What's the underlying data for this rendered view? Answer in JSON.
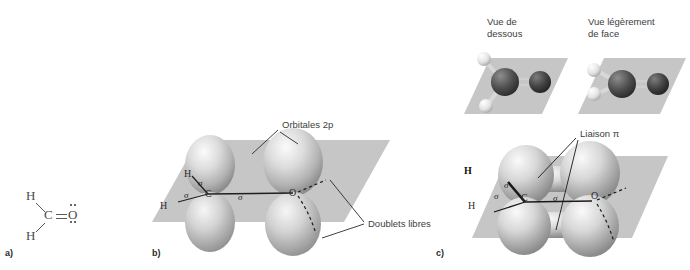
{
  "figure": {
    "panels": [
      {
        "id": "a",
        "letter": "a)",
        "caption": "Structure de Lewis"
      },
      {
        "id": "b",
        "letter": "b)",
        "caption": "Orbitales et liaisons sigma"
      },
      {
        "id": "c",
        "letter": "c)",
        "caption": "Modeles moleculaires et liaison pi"
      }
    ]
  },
  "panel_a": {
    "atoms": [
      {
        "symbol": "H",
        "x": 28,
        "y": 193
      },
      {
        "symbol": "C",
        "x": 46,
        "y": 212
      },
      {
        "symbol": "O",
        "x": 70,
        "y": 212
      },
      {
        "symbol": "H",
        "x": 28,
        "y": 233
      }
    ],
    "lone_pairs_label": "doublets libres sur O",
    "double_bond": "C=O"
  },
  "panel_b": {
    "labels": {
      "orbitals": "Orbitales 2",
      "orbitals_italic": "p",
      "lone_pairs": "Doublets libres"
    },
    "atoms": [
      {
        "symbol": "H",
        "x": 184,
        "y": 174
      },
      {
        "symbol": "H",
        "x": 160,
        "y": 207
      },
      {
        "symbol": "C",
        "x": 207,
        "y": 203
      },
      {
        "symbol": "O",
        "x": 266,
        "y": 202
      }
    ],
    "sigma_labels": [
      {
        "symbol": "σ",
        "x": 198,
        "y": 187
      },
      {
        "symbol": "σ",
        "x": 184,
        "y": 196
      },
      {
        "symbol": "σ",
        "x": 234,
        "y": 205
      }
    ]
  },
  "panel_c": {
    "models": [
      {
        "view_label_line1": "Vue de",
        "view_label_line2": "dessous"
      },
      {
        "view_label_line1": "Vue légèrement",
        "view_label_line2": "de face"
      }
    ],
    "labels": {
      "pi_bond": "Liaison π"
    },
    "atoms": [
      {
        "symbol": "H",
        "x": 466,
        "y": 172
      },
      {
        "symbol": "H",
        "x": 470,
        "y": 207
      },
      {
        "symbol": "C",
        "x": 525,
        "y": 198
      },
      {
        "symbol": "O",
        "x": 592,
        "y": 196
      }
    ],
    "sigma_labels": [
      {
        "symbol": "σ",
        "x": 505,
        "y": 187
      },
      {
        "symbol": "σ",
        "x": 495,
        "y": 198
      },
      {
        "symbol": "σ",
        "x": 550,
        "y": 200
      }
    ]
  },
  "colors": {
    "plane": "#c6c6c6",
    "plane_edge": "#b0b0b0",
    "orbital_light": "#f2f2f2",
    "orbital_mid": "#c0c0c0",
    "orbital_dark": "#8a8a8a",
    "carbon_sphere": "#4a4a4a",
    "oxygen_sphere": "#3c3c3c",
    "hydrogen_sphere": "#f0f0f0",
    "text": "#3d3d3d",
    "leader_line": "#2b2b2b"
  }
}
